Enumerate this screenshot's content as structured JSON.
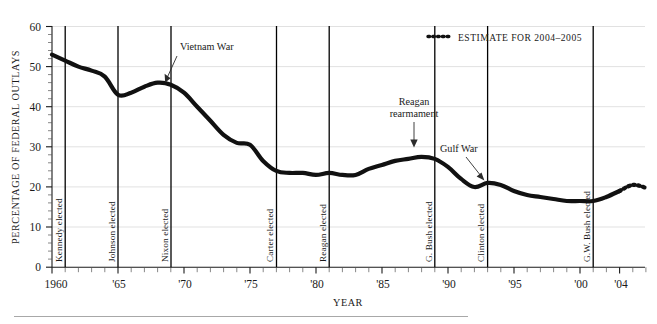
{
  "chart_data": {
    "type": "line",
    "title": "",
    "xlabel": "YEAR",
    "ylabel": "PERCENTAGE OF FEDERAL OUTLAYS",
    "xlim": [
      1960,
      2005
    ],
    "ylim": [
      0,
      60
    ],
    "y_ticks": [
      0,
      10,
      20,
      30,
      40,
      50,
      60
    ],
    "y_tick_labels": [
      "0",
      "10",
      "20",
      "30",
      "40",
      "50",
      "60"
    ],
    "x_ticks": [
      1960,
      1965,
      1970,
      1975,
      1980,
      1985,
      1990,
      1995,
      2000,
      2004
    ],
    "x_tick_labels": [
      "1960",
      "'65",
      "'70",
      "'75",
      "'80",
      "'85",
      "'90",
      "'95",
      "'00",
      "'04"
    ],
    "x_minor_tick_interval": 1,
    "grid": "horizontal",
    "legend_position": "top-right",
    "series": [
      {
        "name": "Defense spending as percentage of federal outlays",
        "style": "solid",
        "x": [
          1960,
          1961,
          1962,
          1963,
          1964,
          1965,
          1966,
          1967,
          1968,
          1969,
          1970,
          1971,
          1972,
          1973,
          1974,
          1975,
          1976,
          1977,
          1978,
          1979,
          1980,
          1981,
          1982,
          1983,
          1984,
          1985,
          1986,
          1987,
          1988,
          1989,
          1990,
          1991,
          1992,
          1993,
          1994,
          1995,
          1996,
          1997,
          1998,
          1999,
          2000,
          2001,
          2002,
          2003
        ],
        "values": [
          53.0,
          51.5,
          50.0,
          49.0,
          47.5,
          43.0,
          43.5,
          45.0,
          46.0,
          45.5,
          43.5,
          40.0,
          36.5,
          33.0,
          31.0,
          30.5,
          26.5,
          24.0,
          23.5,
          23.5,
          23.0,
          23.5,
          23.0,
          23.0,
          24.5,
          25.5,
          26.5,
          27.0,
          27.5,
          27.0,
          25.0,
          22.0,
          20.0,
          21.0,
          20.5,
          19.0,
          18.0,
          17.5,
          17.0,
          16.5,
          16.5,
          16.5,
          17.5,
          19.0
        ]
      },
      {
        "name": "Estimate for 2004–2005",
        "style": "dotted",
        "x": [
          2003,
          2004,
          2005
        ],
        "values": [
          19.0,
          20.5,
          19.8
        ]
      }
    ],
    "legend": [
      {
        "label": "ESTIMATE FOR 2004–2005",
        "style": "dotted"
      }
    ],
    "event_lines": [
      {
        "year": 1961,
        "label": "Kennedy elected"
      },
      {
        "year": 1965,
        "label": "Johnson elected"
      },
      {
        "year": 1969,
        "label": "Nixon elected"
      },
      {
        "year": 1977,
        "label": "Carter elected"
      },
      {
        "year": 1981,
        "label": "Reagan elected"
      },
      {
        "year": 1989,
        "label": "G. Bush elected"
      },
      {
        "year": 1993,
        "label": "Clinton elected"
      },
      {
        "year": 2001,
        "label": "G.W. Bush elected"
      }
    ],
    "annotations": [
      {
        "label": "Vietnam War",
        "lines": [
          "Vietnam War"
        ],
        "point_year": 1968,
        "point_value": 46.0
      },
      {
        "label": "Reagan rearmament",
        "lines": [
          "Reagan",
          "rearmament"
        ],
        "point_year": 1987,
        "point_value": 27.3
      },
      {
        "label": "Gulf War",
        "lines": [
          "Gulf War"
        ],
        "point_year": 1993,
        "point_value": 21.0
      }
    ]
  }
}
